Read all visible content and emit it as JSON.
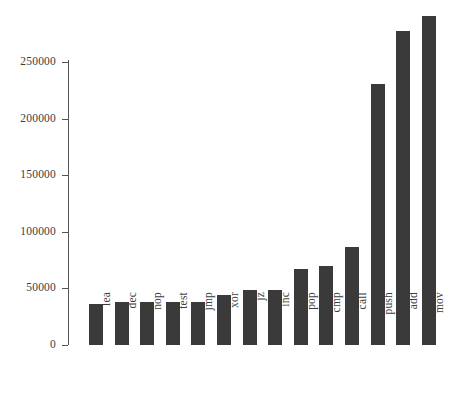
{
  "chart_data": {
    "type": "bar",
    "title": "",
    "subtitle": "",
    "xlabel": "",
    "ylabel": "",
    "categories": [
      "lea",
      "dec",
      "nop",
      "test",
      "jmp",
      "xor",
      "jz",
      "inc",
      "pop",
      "cmp",
      "call",
      "push",
      "add",
      "mov"
    ],
    "values": [
      36300,
      37800,
      38000,
      38200,
      38300,
      43800,
      48700,
      48500,
      67300,
      69600,
      86600,
      231000,
      277500,
      291000
    ],
    "series": [
      {
        "name": "instruction count",
        "values": [
          36300,
          37800,
          38000,
          38200,
          38300,
          43800,
          48700,
          48500,
          67300,
          69600,
          86600,
          231000,
          277500,
          291000
        ]
      }
    ],
    "ylim": [
      0,
      291000
    ],
    "y_ticks": [
      0,
      50000,
      100000,
      150000,
      200000,
      250000
    ],
    "y_tick_labels": [
      "0",
      "50000",
      "100000",
      "150000",
      "200000",
      "250000"
    ],
    "grid": false,
    "legend": false,
    "legend_position": "none",
    "bar_color": "#3a3a3a",
    "axis_color": "#555555",
    "background_color": "#ffffff",
    "x_tick_label_rotation": 90,
    "annotations": []
  }
}
